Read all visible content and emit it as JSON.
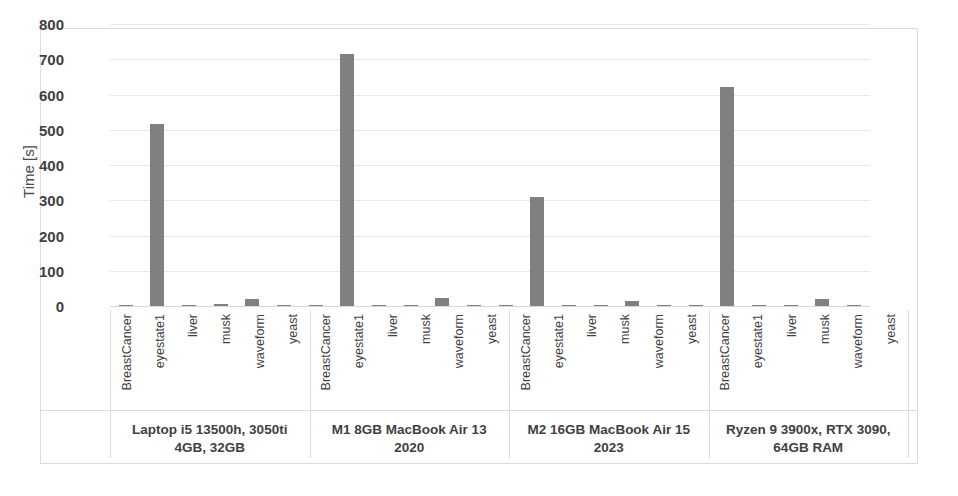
{
  "chart_data": {
    "type": "bar",
    "title": "",
    "subtitle": "",
    "xlabel": "",
    "ylabel": "Time [s]",
    "ylim": [
      0,
      800
    ],
    "ytick_labels": [
      "800",
      "700",
      "600",
      "500",
      "400",
      "300",
      "200",
      "100",
      "0"
    ],
    "ytick_values": [
      800,
      700,
      600,
      500,
      400,
      300,
      200,
      100,
      0
    ],
    "grid": true,
    "legend": "none",
    "bar_color": "#808080",
    "gridline_color": "#e8e8e8",
    "frame_color": "#dcdcdc",
    "categories": [
      "BreastCancer",
      "eyestate1",
      "liver",
      "musk",
      "waveform",
      "yeast"
    ],
    "groups": [
      {
        "label": "Laptop i5 13500h, 3050ti 4GB, 32GB",
        "label_line1": "Laptop i5 13500h, 3050ti",
        "label_line2": "4GB, 32GB",
        "values": [
          1,
          515,
          1,
          5,
          20,
          3
        ]
      },
      {
        "label": "M1 8GB MacBook Air 13 2020",
        "label_line1": "M1 8GB MacBook Air 13",
        "label_line2": "2020",
        "values": [
          1,
          715,
          1,
          4,
          24,
          4
        ]
      },
      {
        "label": "M2 16GB MacBook Air 15 2023",
        "label_line1": "M2 16GB MacBook Air 15",
        "label_line2": "2023",
        "values": [
          1,
          310,
          1,
          3,
          13,
          2
        ]
      },
      {
        "label": "Ryzen 9 3900x, RTX 3090, 64GB RAM",
        "label_line1": "Ryzen 9 3900x, RTX 3090,",
        "label_line2": "64GB RAM",
        "values": [
          1,
          622,
          1,
          4,
          20,
          3
        ]
      }
    ]
  }
}
